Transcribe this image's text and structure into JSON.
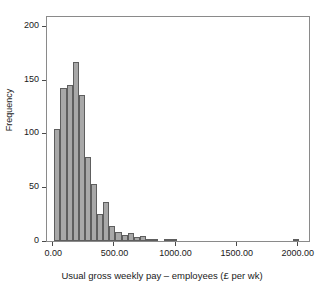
{
  "chart_data": {
    "type": "bar",
    "title": "",
    "subtitle": "",
    "xlabel": "Usual gross weekly pay – employees (£ per wk)",
    "ylabel": "Frequency",
    "xlim": [
      -60,
      2100
    ],
    "ylim": [
      0,
      210
    ],
    "xticks": [
      0,
      500,
      1000,
      1500,
      2000
    ],
    "xtick_labels": [
      "0.00",
      "500.00",
      "1000.00",
      "1500.00",
      "2000.00"
    ],
    "yticks": [
      0,
      50,
      100,
      150,
      200
    ],
    "ytick_labels": [
      "0",
      "50",
      "100",
      "150",
      "200"
    ],
    "grid": false,
    "legend": null,
    "bin_width": 50,
    "bar_color": "#a8a8a8",
    "bar_edge_color": "#5e5e5e",
    "frame_color": "#8a8a8a",
    "background": "#ffffff",
    "bins": [
      {
        "x0": 0,
        "x1": 50,
        "value": 104
      },
      {
        "x0": 50,
        "x1": 100,
        "value": 142
      },
      {
        "x0": 100,
        "x1": 150,
        "value": 145
      },
      {
        "x0": 150,
        "x1": 200,
        "value": 166
      },
      {
        "x0": 200,
        "x1": 250,
        "value": 136
      },
      {
        "x0": 250,
        "x1": 300,
        "value": 78
      },
      {
        "x0": 300,
        "x1": 350,
        "value": 53
      },
      {
        "x0": 350,
        "x1": 400,
        "value": 25
      },
      {
        "x0": 400,
        "x1": 450,
        "value": 36
      },
      {
        "x0": 450,
        "x1": 500,
        "value": 14
      },
      {
        "x0": 500,
        "x1": 550,
        "value": 8
      },
      {
        "x0": 550,
        "x1": 600,
        "value": 6
      },
      {
        "x0": 600,
        "x1": 650,
        "value": 7
      },
      {
        "x0": 650,
        "x1": 700,
        "value": 4
      },
      {
        "x0": 700,
        "x1": 750,
        "value": 5
      },
      {
        "x0": 750,
        "x1": 800,
        "value": 1
      },
      {
        "x0": 800,
        "x1": 850,
        "value": 2
      },
      {
        "x0": 850,
        "x1": 900,
        "value": 0
      },
      {
        "x0": 900,
        "x1": 950,
        "value": 2
      },
      {
        "x0": 950,
        "x1": 1000,
        "value": 1
      },
      {
        "x0": 1950,
        "x1": 2000,
        "value": 1
      }
    ],
    "categories": [
      "0–50",
      "50–100",
      "100–150",
      "150–200",
      "200–250",
      "250–300",
      "300–350",
      "350–400",
      "400–450",
      "450–500",
      "500–550",
      "550–600",
      "600–650",
      "650–700",
      "700–750",
      "750–800",
      "800–850",
      "850–900",
      "900–950",
      "950–1000",
      "1950–2000"
    ],
    "values": [
      104,
      142,
      145,
      166,
      136,
      78,
      53,
      25,
      36,
      14,
      8,
      6,
      7,
      4,
      5,
      1,
      2,
      0,
      2,
      1,
      1
    ]
  }
}
